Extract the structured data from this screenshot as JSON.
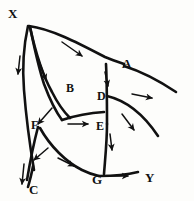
{
  "figure": {
    "kind": "hand-drawn-surface-patch-diagram",
    "title": "",
    "background_color": "#fdfdfb",
    "ink_color": "#111111",
    "stroke_width_main": 2.6,
    "stroke_width_arrow": 1.5
  },
  "vertex_labels": [
    {
      "name": "label-x",
      "text": "X",
      "x": 8,
      "y": 7
    },
    {
      "name": "label-a",
      "text": "A",
      "x": 122,
      "y": 57
    },
    {
      "name": "label-y",
      "text": "Y",
      "x": 145,
      "y": 171
    },
    {
      "name": "label-c",
      "text": "C",
      "x": 29,
      "y": 183
    },
    {
      "name": "label-g",
      "text": "G",
      "x": 92,
      "y": 173
    }
  ],
  "region_labels": [
    {
      "name": "label-b",
      "text": "B",
      "x": 66,
      "y": 82
    },
    {
      "name": "label-d",
      "text": "D",
      "x": 97,
      "y": 90
    },
    {
      "name": "label-e",
      "text": "E",
      "x": 96,
      "y": 120
    },
    {
      "name": "label-f",
      "text": "F",
      "x": 31,
      "y": 119
    }
  ],
  "curves": [
    {
      "name": "curve-x-to-a",
      "d": "M 29,26 C 52,29 80,44 105,57 C 112,60 118,62 124,64"
    },
    {
      "name": "curve-a-to-right-end",
      "d": "M 124,66 C 140,71 158,80 176,92"
    },
    {
      "name": "curve-x-outer-left",
      "d": "M 28,26 C 24,44 22,66 24,90 C 26,116 30,146 34,170"
    },
    {
      "name": "curve-x-inner-left",
      "d": "M 30,27 C 34,46 38,66 44,84 C 50,100 56,112 62,120"
    },
    {
      "name": "curve-b-lower-left",
      "d": "M 30,27 C 35,50 42,74 52,92 C 58,104 64,112 70,118"
    },
    {
      "name": "curve-f-to-g",
      "d": "M 40,128 C 50,146 66,162 82,170 C 88,173 94,175 99,176"
    },
    {
      "name": "curve-c-tail",
      "d": "M 33,166 C 32,172 30,180 28,187"
    },
    {
      "name": "curve-b-to-d-top",
      "d": "M 62,120 C 74,116 88,113 104,112"
    },
    {
      "name": "curve-d-vertical",
      "d": "M 106,64 C 107,84 107,104 107,124"
    },
    {
      "name": "curve-e-g-vertical",
      "d": "M 107,124 C 107,142 105,160 104,174"
    },
    {
      "name": "curve-d-to-right",
      "d": "M 107,96 C 124,100 142,112 158,136"
    },
    {
      "name": "curve-g-to-y",
      "d": "M 99,176 C 112,176 126,175 138,172"
    },
    {
      "name": "curve-left-edge-fork",
      "d": "M 38,127 C 33,146 30,162 27,180"
    }
  ],
  "arrows": [
    {
      "name": "arrow-x-a-flow",
      "from": [
        62,
        42
      ],
      "to": [
        82,
        56
      ],
      "direction": "down-right"
    },
    {
      "name": "arrow-outer-left-flow",
      "from": [
        20,
        56
      ],
      "to": [
        18,
        74
      ],
      "direction": "down"
    },
    {
      "name": "arrow-inner-left-flow",
      "from": [
        38,
        58
      ],
      "to": [
        46,
        80
      ],
      "direction": "down-right"
    },
    {
      "name": "arrow-a-right-flow",
      "from": [
        132,
        94
      ],
      "to": [
        152,
        98
      ],
      "direction": "right"
    },
    {
      "name": "arrow-d-inward",
      "from": [
        105,
        72
      ],
      "to": [
        108,
        86
      ],
      "direction": "down"
    },
    {
      "name": "arrow-b-to-e",
      "from": [
        68,
        124
      ],
      "to": [
        88,
        124
      ],
      "direction": "right"
    },
    {
      "name": "arrow-to-f",
      "from": [
        52,
        108
      ],
      "to": [
        38,
        124
      ],
      "direction": "down-left"
    },
    {
      "name": "arrow-d-right-lower",
      "from": [
        122,
        114
      ],
      "to": [
        134,
        130
      ],
      "direction": "down-right"
    },
    {
      "name": "arrow-e-g-down",
      "from": [
        110,
        134
      ],
      "to": [
        112,
        150
      ],
      "direction": "down"
    },
    {
      "name": "arrow-c-inward",
      "from": [
        48,
        148
      ],
      "to": [
        34,
        160
      ],
      "direction": "down-left"
    },
    {
      "name": "arrow-f-to-g",
      "from": [
        58,
        158
      ],
      "to": [
        74,
        166
      ],
      "direction": "down-right"
    },
    {
      "name": "arrow-c-tail-down",
      "from": [
        24,
        164
      ],
      "to": [
        22,
        184
      ],
      "direction": "down"
    },
    {
      "name": "arrow-g-to-y",
      "from": [
        108,
        176
      ],
      "to": [
        128,
        176
      ],
      "direction": "right"
    }
  ]
}
